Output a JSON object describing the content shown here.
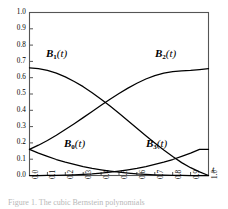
{
  "figure": {
    "caption": "Figure 1.  The cubic Bernstein polynomials"
  },
  "axes": {
    "x_title": "t",
    "y_title": "",
    "x_ticks": [
      "0.0",
      "0.1",
      "0.2",
      "0.3",
      "0.4",
      "0.5",
      "0.6",
      "0.7",
      "0.8",
      "0.9",
      "1.0"
    ],
    "y_ticks": [
      "1.0",
      "0.9",
      "0.8",
      "0.7",
      "0.6",
      "0.5",
      "0.4",
      "0.3",
      "0.2",
      "0.1",
      "0.0"
    ]
  },
  "curve_labels": [
    {
      "id": "B1",
      "base": "B",
      "sub": "1",
      "arg": "(t)",
      "left": 46,
      "top": 47
    },
    {
      "id": "B2",
      "base": "B",
      "sub": "2",
      "arg": "(t)",
      "left": 155,
      "top": 47
    },
    {
      "id": "B0",
      "base": "B",
      "sub": "0",
      "arg": "(t)",
      "left": 64,
      "top": 137
    },
    {
      "id": "B3",
      "base": "B",
      "sub": "3",
      "arg": "(t)",
      "left": 146,
      "top": 137
    }
  ],
  "colors": {
    "curve": "#000000",
    "axis": "#555555",
    "background": "#ffffff"
  },
  "chart_data": {
    "type": "line",
    "title": "",
    "xlabel": "t",
    "ylabel": "",
    "xlim": [
      0.0,
      1.0
    ],
    "ylim": [
      0.0,
      1.0
    ],
    "grid": false,
    "legend_position": "inline-annotations",
    "x": [
      0.0,
      0.05,
      0.1,
      0.15,
      0.2,
      0.25,
      0.3,
      0.35,
      0.4,
      0.45,
      0.5,
      0.55,
      0.6,
      0.65,
      0.7,
      0.75,
      0.8,
      0.85,
      0.9,
      0.95,
      1.0
    ],
    "series": [
      {
        "name": "B_0(t)",
        "label": "B0(t)",
        "values": [
          0.16,
          0.137,
          0.117,
          0.098,
          0.082,
          0.068,
          0.055,
          0.044,
          0.035,
          0.027,
          0.02,
          0.015,
          0.01,
          0.0066,
          0.004,
          0.0021,
          0.0008,
          0.0002,
          0.0,
          0.0,
          0.0
        ]
      },
      {
        "name": "B_1(t)",
        "label": "B1(t)",
        "values": [
          0.66,
          0.655,
          0.645,
          0.628,
          0.605,
          0.577,
          0.545,
          0.508,
          0.468,
          0.426,
          0.382,
          0.336,
          0.29,
          0.244,
          0.199,
          0.156,
          0.116,
          0.079,
          0.048,
          0.022,
          0.0
        ]
      },
      {
        "name": "B_2(t)",
        "label": "B2(t)",
        "values": [
          0.16,
          0.186,
          0.215,
          0.247,
          0.282,
          0.318,
          0.355,
          0.393,
          0.431,
          0.468,
          0.503,
          0.536,
          0.566,
          0.592,
          0.613,
          0.628,
          0.637,
          0.642,
          0.645,
          0.65,
          0.655
        ]
      },
      {
        "name": "B_3(t)",
        "label": "B3(t)",
        "values": [
          0.0,
          0.0,
          0.0002,
          0.0008,
          0.0021,
          0.004,
          0.0066,
          0.01,
          0.015,
          0.02,
          0.027,
          0.035,
          0.044,
          0.055,
          0.068,
          0.082,
          0.098,
          0.117,
          0.137,
          0.16,
          0.16
        ]
      }
    ]
  }
}
